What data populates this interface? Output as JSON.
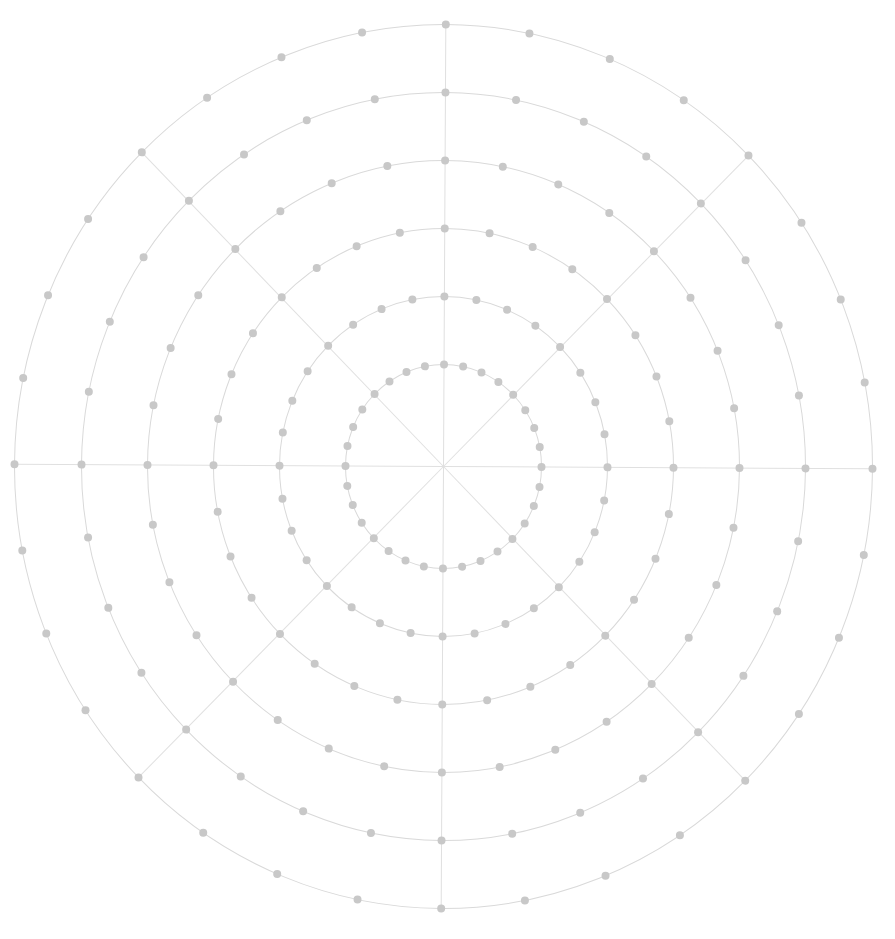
{
  "diagram": {
    "type": "polar-grid",
    "canvas": {
      "width": 895,
      "height": 939,
      "background": "#ffffff"
    },
    "center": {
      "x": 443.5,
      "y": 466.5
    },
    "rotation_deg": 0.3,
    "rings": [
      {
        "index": 1,
        "rx": 98,
        "ry": 102,
        "dot_count": 32
      },
      {
        "index": 2,
        "rx": 164,
        "ry": 170,
        "dot_count": 32
      },
      {
        "index": 3,
        "rx": 230,
        "ry": 238,
        "dot_count": 32
      },
      {
        "index": 4,
        "rx": 296,
        "ry": 306,
        "dot_count": 32
      },
      {
        "index": 5,
        "rx": 362,
        "ry": 374,
        "dot_count": 32
      },
      {
        "index": 6,
        "rx": 429,
        "ry": 442,
        "dot_count": 32
      }
    ],
    "spokes": {
      "count": 8,
      "angles_deg": [
        0,
        45,
        90,
        135,
        180,
        225,
        270,
        315
      ],
      "extend_to_ring": 6
    },
    "style": {
      "ring_color": "#d9d9d9",
      "spoke_color": "#e0e0e0",
      "dot_color": "#c8c8c8",
      "dot_radius": 4,
      "line_width": 1
    }
  }
}
